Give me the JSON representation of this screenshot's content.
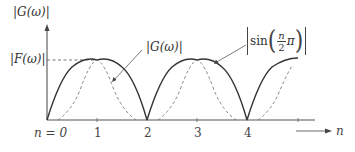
{
  "diagram": {
    "y_axis_label": "|G(ω)|",
    "level_label": "|F(ω)|",
    "curve_label_dashed": "|G(ω)|",
    "curve_label_solid_prefix": "sin",
    "curve_label_solid_num": "n",
    "curve_label_solid_den": "2",
    "curve_label_solid_pi": "π",
    "x_axis_label": "n",
    "ticks": [
      {
        "label": "n = 0",
        "n": 0
      },
      {
        "label": "1",
        "n": 1
      },
      {
        "label": "2",
        "n": 2
      },
      {
        "label": "3",
        "n": 3
      },
      {
        "label": "4",
        "n": 4
      }
    ],
    "colors": {
      "axis": "#555555",
      "solid_curve": "#333333",
      "dashed_curve": "#777777",
      "text": "#333333"
    }
  }
}
